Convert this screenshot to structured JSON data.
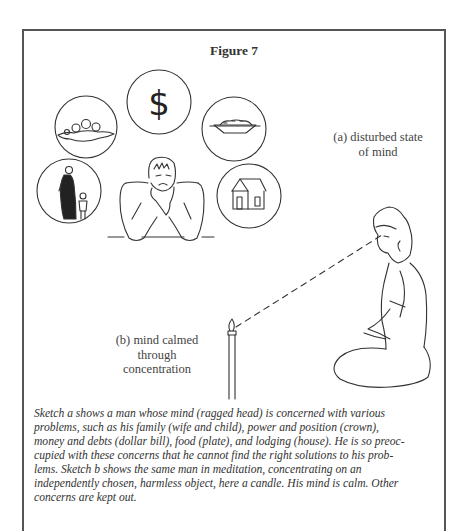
{
  "figure": {
    "title": "Figure 7",
    "label_a_line1": "(a) disturbed state",
    "label_a_line2": "of mind",
    "label_b_line1": "(b) mind calmed",
    "label_b_line2": "through",
    "label_b_line3": "concentration",
    "icons": [
      {
        "name": "crown",
        "meaning": "power and position"
      },
      {
        "name": "dollar",
        "meaning": "money and debts"
      },
      {
        "name": "plate",
        "meaning": "food"
      },
      {
        "name": "family",
        "meaning": "wife and child"
      },
      {
        "name": "house",
        "meaning": "lodging"
      },
      {
        "name": "candle",
        "meaning": "object of concentration"
      }
    ],
    "dollar_glyph": "$"
  },
  "caption": {
    "lines": [
      "Sketch a shows a man whose mind (ragged head) is concerned with various",
      "problems, such as his family (wife and child), power and position (crown),",
      "money and debts (dollar bill), food (plate), and lodging (house). He is so preoc-",
      "cupied with these concerns that he cannot find the right solutions to his prob-",
      "lems. Sketch b shows the same man in meditation, concentrating on an",
      "independently chosen, harmless object, here a candle. His mind is calm. Other",
      "concerns are kept out."
    ]
  }
}
